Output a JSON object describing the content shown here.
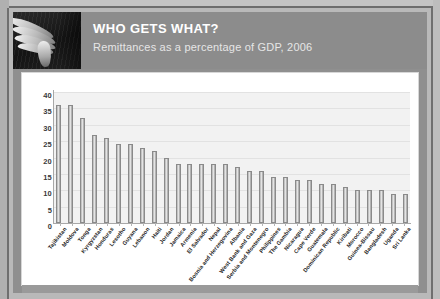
{
  "header": {
    "title": "WHO GETS WHAT?",
    "subtitle": "Remittances as a percentage of GDP, 2006",
    "photo_alt": "hand-photo"
  },
  "colors": {
    "page_background": "#b9b9b9",
    "header_band": "#8c8c8c",
    "card_background": "#ffffff",
    "plot_background": "#f2f2f2",
    "bar_fill": "#d2d2d2",
    "bar_stroke": "#8a8a8a",
    "title_text": "#ffffff",
    "subtitle_text": "#e6e6e6",
    "axis": "#a8a8a8"
  },
  "chart_data": {
    "type": "bar",
    "title": "WHO GETS WHAT?",
    "subtitle": "Remittances as a percentage of GDP, 2006",
    "xlabel": "",
    "ylabel": "",
    "ylim": [
      0,
      40
    ],
    "yticks": [
      0,
      5,
      10,
      15,
      20,
      25,
      30,
      35,
      40
    ],
    "grid": true,
    "legend": "none",
    "categories": [
      "Tajikistan",
      "Moldova",
      "Tonga",
      "Kyrgyzstan",
      "Honduras",
      "Lesotho",
      "Guyana",
      "Lebanon",
      "Haiti",
      "Jordan",
      "Jamaica",
      "Armenia",
      "El Salvador",
      "Nepal",
      "Bosnia and Herzegovina",
      "Albania",
      "West Bank and Gaza",
      "Serbia and Montenegro",
      "Philippines",
      "The Gambia",
      "Nicaragua",
      "Cape Verde",
      "Guatemala",
      "Dominican Republic",
      "Kiribati",
      "Morocco",
      "Guinea-Bissau",
      "Bangladesh",
      "Uganda",
      "Sri Lanka"
    ],
    "values": [
      36,
      36,
      32,
      27,
      26,
      24,
      24,
      23,
      22,
      20,
      18,
      18,
      18,
      18,
      18,
      17,
      16,
      16,
      14,
      14,
      13,
      13,
      12,
      12,
      11,
      10,
      10,
      10,
      9,
      9
    ]
  }
}
